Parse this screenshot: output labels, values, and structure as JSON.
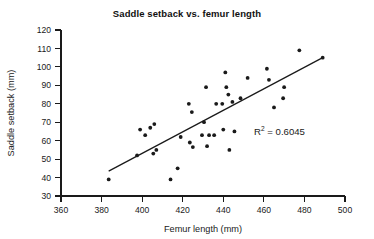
{
  "chart_data": {
    "type": "scatter",
    "title": "Saddle setback vs. femur length",
    "xlabel": "Femur length (mm)",
    "ylabel": "Saddle setback (mm)",
    "xlim": [
      360,
      500
    ],
    "ylim": [
      30,
      120
    ],
    "xticks": [
      360,
      380,
      400,
      420,
      440,
      460,
      480,
      500
    ],
    "yticks": [
      30,
      40,
      50,
      60,
      70,
      80,
      90,
      100,
      110,
      120
    ],
    "grid": false,
    "legend": null,
    "annotations": [
      {
        "name": "r-squared",
        "text": "R2 = 0.6045",
        "base": "R",
        "superscript": "2",
        "rest": " = 0.6045",
        "x": 470,
        "y": 68
      }
    ],
    "trendline": {
      "type": "linear",
      "x": [
        383.5,
        489.0
      ],
      "y": [
        43.5,
        105.0
      ],
      "r_squared": 0.6045
    },
    "points": [
      {
        "x": 383.5,
        "y": 39.0
      },
      {
        "x": 397.5,
        "y": 52.0
      },
      {
        "x": 399.0,
        "y": 66.0
      },
      {
        "x": 401.5,
        "y": 63.0
      },
      {
        "x": 404.0,
        "y": 67.0
      },
      {
        "x": 405.5,
        "y": 53.0
      },
      {
        "x": 406.0,
        "y": 69.0
      },
      {
        "x": 407.0,
        "y": 55.0
      },
      {
        "x": 414.0,
        "y": 39.0
      },
      {
        "x": 417.5,
        "y": 45.0
      },
      {
        "x": 419.0,
        "y": 62.0
      },
      {
        "x": 423.0,
        "y": 80.0
      },
      {
        "x": 423.5,
        "y": 59.0
      },
      {
        "x": 424.5,
        "y": 75.5
      },
      {
        "x": 425.0,
        "y": 56.5
      },
      {
        "x": 429.5,
        "y": 63.0
      },
      {
        "x": 430.5,
        "y": 70.0
      },
      {
        "x": 431.5,
        "y": 89.0
      },
      {
        "x": 432.0,
        "y": 57.0
      },
      {
        "x": 433.0,
        "y": 63.0
      },
      {
        "x": 435.5,
        "y": 63.0
      },
      {
        "x": 436.5,
        "y": 80.0
      },
      {
        "x": 439.5,
        "y": 80.0
      },
      {
        "x": 440.0,
        "y": 66.0
      },
      {
        "x": 441.0,
        "y": 97.0
      },
      {
        "x": 441.5,
        "y": 89.0
      },
      {
        "x": 442.5,
        "y": 85.0
      },
      {
        "x": 443.0,
        "y": 55.0
      },
      {
        "x": 444.5,
        "y": 81.0
      },
      {
        "x": 445.5,
        "y": 65.0
      },
      {
        "x": 448.5,
        "y": 83.0
      },
      {
        "x": 452.0,
        "y": 94.0
      },
      {
        "x": 461.5,
        "y": 99.0
      },
      {
        "x": 462.5,
        "y": 93.0
      },
      {
        "x": 465.0,
        "y": 78.0
      },
      {
        "x": 469.5,
        "y": 83.0
      },
      {
        "x": 470.0,
        "y": 89.0
      },
      {
        "x": 477.5,
        "y": 109.0
      },
      {
        "x": 489.0,
        "y": 105.0
      }
    ]
  }
}
